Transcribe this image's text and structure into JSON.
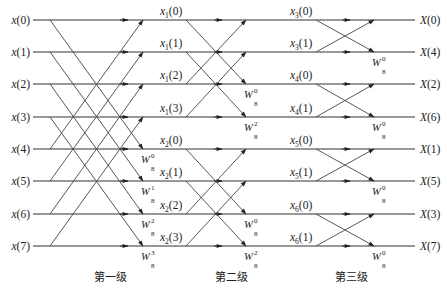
{
  "diagram": {
    "rows_y": [
      20,
      52,
      84,
      117,
      149,
      181,
      214,
      246
    ],
    "line_x_start": 33,
    "line_x_end": 415,
    "inputs": [
      "x(0)",
      "x(1)",
      "x(2)",
      "x(3)",
      "x(4)",
      "x(5)",
      "x(6)",
      "x(7)"
    ],
    "outputs": [
      "X(0)",
      "X(4)",
      "X(2)",
      "X(6)",
      "X(1)",
      "X(5)",
      "X(3)",
      "X(7)"
    ],
    "stage1": {
      "label": "第一级",
      "x_start": 50,
      "x_end": 143,
      "arrow_x": 128,
      "pairs": [
        [
          0,
          4
        ],
        [
          1,
          5
        ],
        [
          2,
          6
        ],
        [
          3,
          7
        ]
      ],
      "twiddles": [
        {
          "row": 4,
          "exp": "0",
          "base": "W",
          "sub": "8"
        },
        {
          "row": 5,
          "exp": "1",
          "base": "W",
          "sub": "8"
        },
        {
          "row": 6,
          "exp": "2",
          "base": "W",
          "sub": "8"
        },
        {
          "row": 7,
          "exp": "3",
          "base": "W",
          "sub": "8"
        }
      ],
      "node_labels": [
        {
          "row": 0,
          "name": "x",
          "sub": "1",
          "idx": "(0)"
        },
        {
          "row": 1,
          "name": "x",
          "sub": "1",
          "idx": "(1)"
        },
        {
          "row": 2,
          "name": "x",
          "sub": "1",
          "idx": "(2)"
        },
        {
          "row": 3,
          "name": "x",
          "sub": "1",
          "idx": "(3)"
        },
        {
          "row": 4,
          "name": "x",
          "sub": "2",
          "idx": "(0)"
        },
        {
          "row": 5,
          "name": "x",
          "sub": "2",
          "idx": "(1)"
        },
        {
          "row": 6,
          "name": "x",
          "sub": "2",
          "idx": "(2)"
        },
        {
          "row": 7,
          "name": "x",
          "sub": "2",
          "idx": "(3)"
        }
      ]
    },
    "stage2": {
      "label": "第二级",
      "x_start": 186,
      "x_end": 246,
      "arrow_x": 222,
      "pairs": [
        [
          0,
          2
        ],
        [
          1,
          3
        ],
        [
          4,
          6
        ],
        [
          5,
          7
        ]
      ],
      "twiddles": [
        {
          "row": 2,
          "exp": "0",
          "base": "W",
          "sub": "8"
        },
        {
          "row": 3,
          "exp": "2",
          "base": "W",
          "sub": "8"
        },
        {
          "row": 6,
          "exp": "0",
          "base": "W",
          "sub": "8"
        },
        {
          "row": 7,
          "exp": "2",
          "base": "W",
          "sub": "8"
        }
      ],
      "node_labels": [
        {
          "row": 0,
          "name": "x",
          "sub": "3",
          "idx": "(0)"
        },
        {
          "row": 1,
          "name": "x",
          "sub": "3",
          "idx": "(1)"
        },
        {
          "row": 2,
          "name": "x",
          "sub": "4",
          "idx": "(0)"
        },
        {
          "row": 3,
          "name": "x",
          "sub": "4",
          "idx": "(1)"
        },
        {
          "row": 4,
          "name": "x",
          "sub": "5",
          "idx": "(0)"
        },
        {
          "row": 5,
          "name": "x",
          "sub": "5",
          "idx": "(1)"
        },
        {
          "row": 6,
          "name": "x",
          "sub": "6",
          "idx": "(0)"
        },
        {
          "row": 7,
          "name": "x",
          "sub": "6",
          "idx": "(1)"
        }
      ]
    },
    "stage3": {
      "label": "第三级",
      "x_start": 316,
      "x_end": 374,
      "arrow_x": 350,
      "pairs": [
        [
          0,
          1
        ],
        [
          2,
          3
        ],
        [
          4,
          5
        ],
        [
          6,
          7
        ]
      ],
      "twiddles": [
        {
          "row": 1,
          "exp": "0",
          "base": "W",
          "sub": "8"
        },
        {
          "row": 3,
          "exp": "0",
          "base": "W",
          "sub": "8"
        },
        {
          "row": 5,
          "exp": "0",
          "base": "W",
          "sub": "8"
        },
        {
          "row": 7,
          "exp": "0",
          "base": "W",
          "sub": "8"
        }
      ]
    },
    "stage_label_y": 281,
    "colors": {
      "line": "#333333",
      "text": "#222222",
      "background": "#ffffff"
    }
  }
}
